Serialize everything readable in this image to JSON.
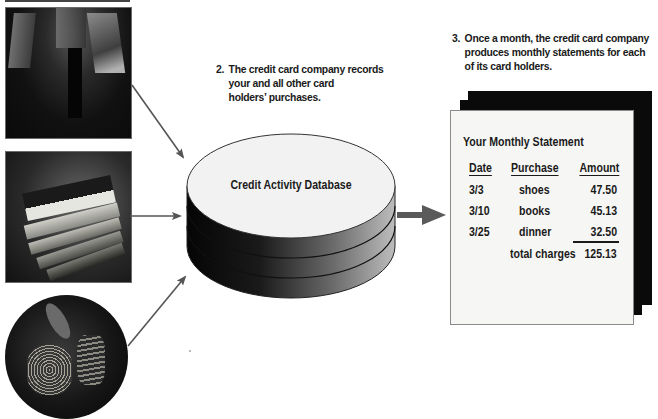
{
  "diagram": {
    "step2": {
      "number": "2.",
      "lines": [
        "The credit card company records",
        "your and all other card",
        "holders’ purchases."
      ]
    },
    "step3": {
      "number": "3.",
      "lines": [
        "Once a month, the credit card company",
        "produces monthly statements for each",
        "of its card holders."
      ]
    },
    "photos": [
      {
        "name": "shopping-bags-photo",
        "subject": "shopper with shopping bags"
      },
      {
        "name": "books-photo",
        "subject": "stack of books"
      },
      {
        "name": "dinner-photo",
        "subject": "plate of dinner"
      }
    ],
    "database": {
      "label": "Credit Activity Database"
    },
    "statement": {
      "title": "Your Monthly Statement",
      "headers": {
        "date": "Date",
        "purchase": "Purchase",
        "amount": "Amount"
      },
      "rows": [
        {
          "date": "3/3",
          "purchase": "shoes",
          "amount": "47.50"
        },
        {
          "date": "3/10",
          "purchase": "books",
          "amount": "45.13"
        },
        {
          "date": "3/25",
          "purchase": "dinner",
          "amount": "32.50"
        }
      ],
      "total_label": "total charges",
      "total_value": "125.13"
    },
    "colors": {
      "arrow": "#555555",
      "page_dark": "#0a0a0a",
      "page_light": "#f6f6f4",
      "db_top": "#f2f2f2"
    }
  }
}
